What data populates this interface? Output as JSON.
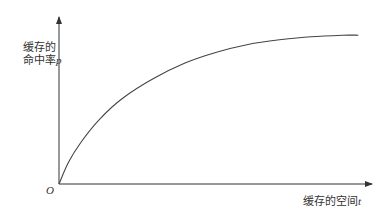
{
  "chart_data": {
    "type": "line",
    "title": "",
    "xlabel": "缓存的空间t",
    "ylabel": "缓存的命中率p",
    "ylabel_lines": [
      "缓存的",
      "命中率"
    ],
    "ylabel_var": "p",
    "xlabel_text": "缓存的空间",
    "xlabel_var": "t",
    "origin_label": "O",
    "grid": false,
    "legend": null,
    "axis_ticks": "none",
    "x_range": [
      0,
      1
    ],
    "y_range": [
      0,
      1
    ],
    "series": [
      {
        "name": "命中率曲线",
        "description": "Concave saturating curve: hit rate rises quickly with cache size then plateaus",
        "x": [
          0.0,
          0.03,
          0.07,
          0.13,
          0.2,
          0.3,
          0.4,
          0.5,
          0.6,
          0.7,
          0.8,
          0.9,
          0.95
        ],
        "y": [
          0.0,
          0.14,
          0.27,
          0.42,
          0.55,
          0.68,
          0.78,
          0.85,
          0.9,
          0.93,
          0.95,
          0.96,
          0.96
        ]
      }
    ]
  },
  "colors": {
    "axis": "#333333",
    "curve": "#444444",
    "background": "#ffffff"
  }
}
